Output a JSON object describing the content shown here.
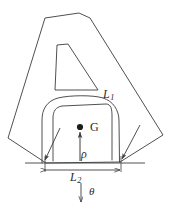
{
  "figure": {
    "background_color": "#ffffff",
    "line_color": "#3c3c3c",
    "label_color": "#2b2b2b",
    "labels": {
      "arch_length": {
        "symbol": "L",
        "subscript": "1",
        "text": "L1"
      },
      "base_width": {
        "symbol": "L",
        "subscript": "2",
        "text": "L2"
      },
      "centroid": {
        "text": "G"
      },
      "radius": {
        "text": "ρ"
      },
      "angle": {
        "text": "θ"
      }
    },
    "annotations": {
      "centroid_marker": "filled-dot",
      "rho_arrow": "up-arrow-from-base-to-centroid",
      "theta_arrow": "down-arrow-below-base",
      "base_dimension": "double-headed-arrow",
      "leg_arrows": "two-inward-arrows-at-feet"
    },
    "geometry": {
      "outer_outline": "190,18 79,13 45,18 8,138 46,163 120,162 163,135",
      "counter": "57,45 68,44 98,90 55,90",
      "arch_outer": "42,163 42,118 48,104 62,97 95,96 110,101 119,117 120,162",
      "arch_inner": "53,160 53,117 57,108 62,105 106,104 110,110 112,118 112,160",
      "base_line_y": 163,
      "dimension_line_y": 170,
      "centroid_point": [
        80,
        127
      ],
      "rho_arrow_from": [
        80,
        160
      ],
      "rho_arrow_to": [
        80,
        131
      ],
      "theta_arrow_from": [
        81,
        183
      ],
      "theta_arrow_to": [
        81,
        203
      ]
    }
  }
}
